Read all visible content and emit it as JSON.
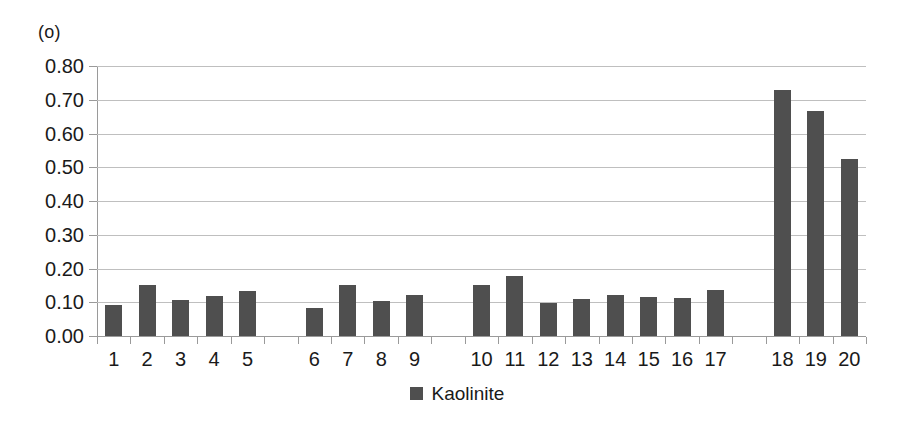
{
  "chart_data": {
    "type": "bar",
    "title": "(o)",
    "xlabel": "",
    "ylabel": "",
    "ylim": [
      0.0,
      0.8
    ],
    "ytick_labels": [
      "0.80",
      "0.70",
      "0.60",
      "0.50",
      "0.40",
      "0.30",
      "0.20",
      "0.10",
      "0.00"
    ],
    "ytick_values": [
      0.8,
      0.7,
      0.6,
      0.5,
      0.4,
      0.3,
      0.2,
      0.1,
      0.0
    ],
    "grid": true,
    "categories": [
      "1",
      "2",
      "3",
      "4",
      "5",
      "6",
      "7",
      "8",
      "9",
      "10",
      "11",
      "12",
      "13",
      "14",
      "15",
      "16",
      "17",
      "18",
      "19",
      "20"
    ],
    "values": [
      0.093,
      0.152,
      0.108,
      0.118,
      0.133,
      0.083,
      0.151,
      0.103,
      0.123,
      0.152,
      0.178,
      0.099,
      0.111,
      0.122,
      0.117,
      0.114,
      0.136,
      0.73,
      0.668,
      0.525
    ],
    "slot_gaps_after": [
      "5",
      "9",
      "17"
    ],
    "legend": {
      "position": "bottom-center",
      "entries": [
        {
          "label": "Kaolinite",
          "color": "#4f4f4f",
          "marker": "square"
        }
      ]
    },
    "series": [
      {
        "name": "Kaolinite",
        "color": "#4f4f4f",
        "values": [
          0.093,
          0.152,
          0.108,
          0.118,
          0.133,
          0.083,
          0.151,
          0.103,
          0.123,
          0.152,
          0.178,
          0.099,
          0.111,
          0.122,
          0.117,
          0.114,
          0.136,
          0.73,
          0.668,
          0.525
        ]
      }
    ]
  },
  "colors": {
    "bar": "#4f4f4f",
    "grid": "#bfbfbf",
    "axis": "#9a9a9a",
    "text": "#1a1a1a",
    "background": "#ffffff"
  }
}
